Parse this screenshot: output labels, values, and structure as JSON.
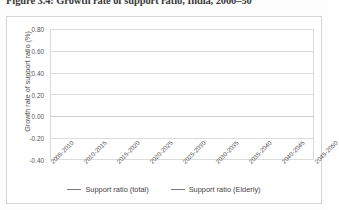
{
  "figure": {
    "caption": "Figure 3.4: Growth rate of support ratio, India, 2000–50"
  },
  "legend": {
    "position": "bottom",
    "items": [
      {
        "label": "Support ratio (total)",
        "color": "#808080"
      },
      {
        "label": "Support ratio  (Elderly)",
        "color": "#808080"
      }
    ]
  },
  "axis": {
    "y_title": "Growth rate of support ratio (%)",
    "y_ticks": [
      "0.80",
      "0.60",
      "0.40",
      "0.20",
      "0.00",
      "-0.20",
      "-0.40"
    ]
  },
  "chart_data": {
    "type": "line",
    "title": "Figure 3.4: Growth rate of support ratio, India, 2000–50",
    "xlabel": "",
    "ylabel": "Growth rate of support ratio (%)",
    "ylim": [
      -0.4,
      0.8
    ],
    "ytick_step": 0.2,
    "grid": true,
    "legend_position": "bottom",
    "categories": [
      "2005-2010",
      "2010-2015",
      "2015-2020",
      "2020-2025",
      "2025-2030",
      "2030-2035",
      "2035-2040",
      "2040-2045",
      "2045-2050"
    ],
    "series": [
      {
        "name": "Support ratio (total)",
        "color": "#808080",
        "values": [
          -0.17,
          -0.29,
          -0.2,
          -0.27,
          -0.28,
          -0.29,
          -0.23,
          -0.18,
          -0.24
        ]
      },
      {
        "name": "Support ratio  (Elderly)",
        "color": "#808080",
        "values": [
          0.68,
          0.37,
          0.33,
          0.27,
          0.19,
          0.1,
          0.01,
          -0.09,
          -0.21
        ]
      }
    ]
  }
}
